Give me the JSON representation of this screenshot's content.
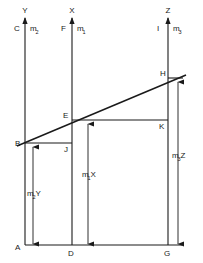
{
  "diagram": {
    "stroke_color": "#1a1a1a",
    "background_color": "#ffffff",
    "top_axes": [
      {
        "name": "left-axis",
        "arrow_label": "Y",
        "foot_label": "C",
        "mass_label": "m",
        "mass_sub": "2",
        "x": 25
      },
      {
        "name": "middle-axis",
        "arrow_label": "X",
        "foot_label": "F",
        "mass_label": "m",
        "mass_sub": "1",
        "x": 72
      },
      {
        "name": "right-axis",
        "arrow_label": "Z",
        "foot_label": "I",
        "mass_label": "m",
        "mass_sub": "3",
        "x": 168
      }
    ],
    "points": [
      {
        "id": "A",
        "label": "A",
        "x": 25,
        "y": 245
      },
      {
        "id": "B",
        "label": "B",
        "x": 25,
        "y": 143
      },
      {
        "id": "D",
        "label": "D",
        "x": 72,
        "y": 245
      },
      {
        "id": "E",
        "label": "E",
        "x": 72,
        "y": 120
      },
      {
        "id": "G",
        "label": "G",
        "x": 168,
        "y": 245
      },
      {
        "id": "H",
        "label": "H",
        "x": 168,
        "y": 78
      },
      {
        "id": "J",
        "label": "J",
        "x": 72,
        "y": 143
      },
      {
        "id": "K",
        "label": "K",
        "x": 168,
        "y": 120
      }
    ],
    "dimensions": [
      {
        "id": "m2Y",
        "label": "m",
        "sub": "2",
        "suffix": "Y",
        "x": 33,
        "from_y": 148,
        "to_y": 245
      },
      {
        "id": "m1X",
        "label": "m",
        "sub": "1",
        "suffix": "X",
        "x": 88,
        "from_y": 125,
        "to_y": 245
      },
      {
        "id": "m3Z",
        "label": "m",
        "sub": "3",
        "suffix": "Z",
        "x": 178,
        "from_y": 83,
        "to_y": 245
      }
    ],
    "lines": {
      "baseline": {
        "name": "baseline-A-G",
        "x1": 25,
        "y1": 245,
        "x2": 182,
        "y2": 245
      },
      "slant": {
        "name": "slant-line-B-H",
        "x1": 17,
        "y1": 146,
        "x2": 186,
        "y2": 75
      },
      "bj": {
        "name": "horizontal-B-J",
        "x1": 25,
        "y1": 143,
        "x2": 72,
        "y2": 143
      },
      "ek": {
        "name": "horizontal-E-K",
        "x1": 72,
        "y1": 120,
        "x2": 168,
        "y2": 120
      },
      "h_tick": {
        "name": "tick-at-H",
        "x1": 168,
        "y1": 78,
        "x2": 183,
        "y2": 78
      }
    }
  }
}
